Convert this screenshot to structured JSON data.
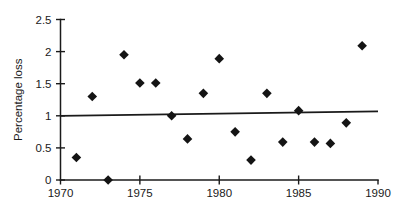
{
  "chart_data": {
    "type": "scatter",
    "title": "",
    "xlabel": "",
    "ylabel": "Percentage loss",
    "xlim": [
      1970,
      1990
    ],
    "ylim": [
      0,
      2.5
    ],
    "grid": false,
    "legend": "none",
    "marker_style": "filled-diamond",
    "marker_color": "#141414",
    "xticks": [
      1970,
      1975,
      1980,
      1985,
      1990
    ],
    "xtick_labels": [
      "1970",
      "1975",
      "1980",
      "1985",
      "1990"
    ],
    "xminor_ticks": [
      1975,
      1980,
      1985
    ],
    "yticks": [
      0,
      0.5,
      1,
      1.5,
      2,
      2.5
    ],
    "ytick_labels": [
      "0",
      "0.5",
      "1",
      "1.5",
      "2",
      "2.5"
    ],
    "x": [
      1971,
      1972,
      1973,
      1974,
      1975,
      1976,
      1977,
      1978,
      1979,
      1980,
      1981,
      1982,
      1983,
      1984,
      1985,
      1986,
      1987,
      1988,
      1989
    ],
    "values": [
      0.35,
      1.3,
      0.0,
      1.95,
      1.51,
      1.51,
      1.0,
      0.64,
      1.35,
      1.89,
      0.75,
      0.31,
      1.35,
      0.59,
      1.08,
      0.59,
      0.57,
      0.89,
      2.09
    ],
    "points": [
      {
        "x": 1971,
        "y": 0.35
      },
      {
        "x": 1972,
        "y": 1.3
      },
      {
        "x": 1973,
        "y": 0.0
      },
      {
        "x": 1974,
        "y": 1.95
      },
      {
        "x": 1975,
        "y": 1.51
      },
      {
        "x": 1976,
        "y": 1.51
      },
      {
        "x": 1977,
        "y": 1.0
      },
      {
        "x": 1978,
        "y": 0.64
      },
      {
        "x": 1979,
        "y": 1.35
      },
      {
        "x": 1980,
        "y": 1.89
      },
      {
        "x": 1981,
        "y": 0.75
      },
      {
        "x": 1982,
        "y": 0.31
      },
      {
        "x": 1983,
        "y": 1.35
      },
      {
        "x": 1984,
        "y": 0.59
      },
      {
        "x": 1985,
        "y": 1.08
      },
      {
        "x": 1986,
        "y": 0.59
      },
      {
        "x": 1987,
        "y": 0.57
      },
      {
        "x": 1988,
        "y": 0.89
      },
      {
        "x": 1989,
        "y": 2.09
      }
    ],
    "trend_line": {
      "x0": 1970,
      "y0": 1.0,
      "x1": 1990,
      "y1": 1.07,
      "color": "#1a1a1a"
    },
    "axis_color": "#1a1a1a"
  }
}
